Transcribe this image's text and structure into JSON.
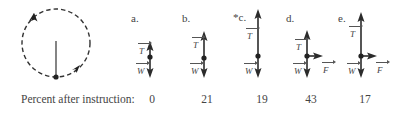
{
  "figure": {
    "pendulum": {
      "description": "ball on string moving in vertical circle, shown at bottom",
      "path_style": "dashed",
      "direction": "counterclockwise"
    },
    "options": [
      {
        "id": "a",
        "label": "a.",
        "vectors": [
          "T",
          "W"
        ],
        "percent": "0"
      },
      {
        "id": "b",
        "label": "b.",
        "vectors": [
          "T",
          "W"
        ],
        "percent": "21"
      },
      {
        "id": "c",
        "label": "*c.",
        "vectors": [
          "T",
          "W"
        ],
        "percent": "19"
      },
      {
        "id": "d",
        "label": "d.",
        "vectors": [
          "T",
          "W",
          "F"
        ],
        "percent": "43"
      },
      {
        "id": "e",
        "label": "e.",
        "vectors": [
          "T",
          "W",
          "F"
        ],
        "percent": "17"
      }
    ],
    "row_label": "Percent after instruction:"
  },
  "colors": {
    "ink": "#2b2b2b",
    "text": "#444444",
    "background": "#ffffff"
  }
}
